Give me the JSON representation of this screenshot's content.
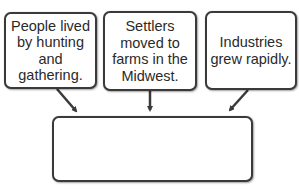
{
  "diagram": {
    "type": "cause-effect organizer",
    "cause_boxes": [
      {
        "text": "People lived\nby hunting\nand\ngathering."
      },
      {
        "text": "Settlers\nmoved to\nfarms in the\nMidwest."
      },
      {
        "text": "Industries\ngrew rapidly."
      }
    ],
    "answer_box": {
      "text": ""
    },
    "colors": {
      "border": "#3a3a3a",
      "text": "#2a2a2a",
      "background": "#ffffff"
    }
  }
}
